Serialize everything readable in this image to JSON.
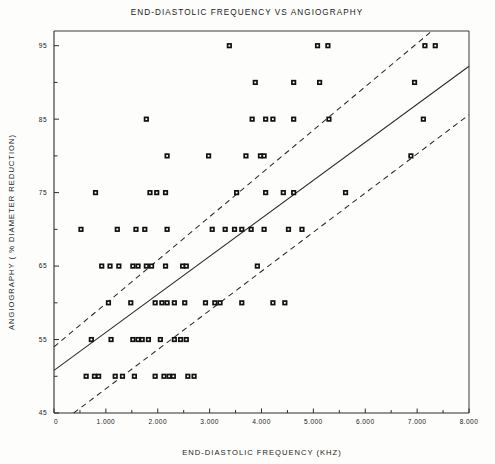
{
  "chart_data": {
    "type": "scatter",
    "title": "END-DIASTOLIC FREQUENCY VS ANGIOGRAPHY",
    "xlabel": "END-DIASTOLIC FREQUENCY (KHZ)",
    "ylabel": "ANGIOGRAPHY ( % DIAMETER REDUCTION)",
    "xlim": [
      0,
      8
    ],
    "ylim": [
      45,
      97
    ],
    "grid": false,
    "legend": null,
    "xticks": [
      0,
      1,
      2,
      3,
      4,
      5,
      6,
      7,
      8
    ],
    "xtick_labels": [
      "0",
      "1.000",
      "2.000",
      "3.000",
      "4.000",
      "5.000",
      "6.000",
      "7.000",
      "8.000"
    ],
    "yticks": [
      45,
      55,
      65,
      75,
      85,
      95
    ],
    "ytick_labels": [
      "45",
      "55",
      "65",
      "75",
      "85",
      "95"
    ],
    "yminor": [
      50,
      60,
      70,
      80,
      90
    ],
    "marker": "asterisk-square",
    "marker_color": "#111111",
    "points": [
      [
        0.62,
        50
      ],
      [
        0.78,
        50
      ],
      [
        0.86,
        50
      ],
      [
        1.18,
        50
      ],
      [
        1.32,
        50
      ],
      [
        1.55,
        50
      ],
      [
        1.95,
        50
      ],
      [
        2.12,
        50
      ],
      [
        2.22,
        50
      ],
      [
        2.3,
        50
      ],
      [
        2.58,
        50
      ],
      [
        2.7,
        50
      ],
      [
        0.72,
        55
      ],
      [
        1.1,
        55
      ],
      [
        1.52,
        55
      ],
      [
        1.62,
        55
      ],
      [
        1.7,
        55
      ],
      [
        1.82,
        55
      ],
      [
        2.05,
        55
      ],
      [
        2.32,
        55
      ],
      [
        2.44,
        55
      ],
      [
        2.55,
        55
      ],
      [
        1.05,
        60
      ],
      [
        1.48,
        60
      ],
      [
        1.95,
        60
      ],
      [
        2.08,
        60
      ],
      [
        2.18,
        60
      ],
      [
        2.32,
        60
      ],
      [
        2.52,
        60
      ],
      [
        2.92,
        60
      ],
      [
        3.1,
        60
      ],
      [
        3.2,
        60
      ],
      [
        3.62,
        60
      ],
      [
        4.22,
        60
      ],
      [
        4.45,
        60
      ],
      [
        0.92,
        65
      ],
      [
        1.08,
        65
      ],
      [
        1.25,
        65
      ],
      [
        1.52,
        65
      ],
      [
        1.62,
        65
      ],
      [
        1.78,
        65
      ],
      [
        1.88,
        65
      ],
      [
        2.15,
        65
      ],
      [
        2.48,
        65
      ],
      [
        2.55,
        65
      ],
      [
        3.92,
        65
      ],
      [
        0.52,
        70
      ],
      [
        1.22,
        70
      ],
      [
        1.58,
        70
      ],
      [
        1.75,
        70
      ],
      [
        2.18,
        70
      ],
      [
        3.05,
        70
      ],
      [
        3.3,
        70
      ],
      [
        3.48,
        70
      ],
      [
        3.62,
        70
      ],
      [
        3.8,
        70
      ],
      [
        4.05,
        70
      ],
      [
        4.52,
        70
      ],
      [
        4.78,
        70
      ],
      [
        0.8,
        75
      ],
      [
        1.85,
        75
      ],
      [
        1.98,
        75
      ],
      [
        2.15,
        75
      ],
      [
        3.52,
        75
      ],
      [
        4.08,
        75
      ],
      [
        4.42,
        75
      ],
      [
        4.62,
        75
      ],
      [
        5.62,
        75
      ],
      [
        2.18,
        80
      ],
      [
        2.98,
        80
      ],
      [
        3.7,
        80
      ],
      [
        3.98,
        80
      ],
      [
        4.05,
        80
      ],
      [
        6.88,
        80
      ],
      [
        1.78,
        85
      ],
      [
        3.82,
        85
      ],
      [
        4.08,
        85
      ],
      [
        4.22,
        85
      ],
      [
        4.62,
        85
      ],
      [
        5.3,
        85
      ],
      [
        7.12,
        85
      ],
      [
        3.88,
        90
      ],
      [
        4.62,
        90
      ],
      [
        5.12,
        90
      ],
      [
        6.95,
        90
      ],
      [
        3.38,
        95
      ],
      [
        5.08,
        95
      ],
      [
        5.28,
        95
      ],
      [
        7.15,
        95
      ],
      [
        7.35,
        95
      ]
    ],
    "fit_line": {
      "name": "regression",
      "style": "solid",
      "x": [
        0.0,
        8.0
      ],
      "y": [
        50.8,
        92.2
      ]
    },
    "confidence_bands": [
      {
        "name": "upper-band",
        "style": "dashed",
        "x": [
          0.0,
          7.25
        ],
        "y": [
          54.0,
          96.8
        ]
      },
      {
        "name": "lower-band",
        "style": "dashed",
        "x": [
          0.38,
          8.0
        ],
        "y": [
          45.0,
          85.6
        ]
      }
    ]
  }
}
